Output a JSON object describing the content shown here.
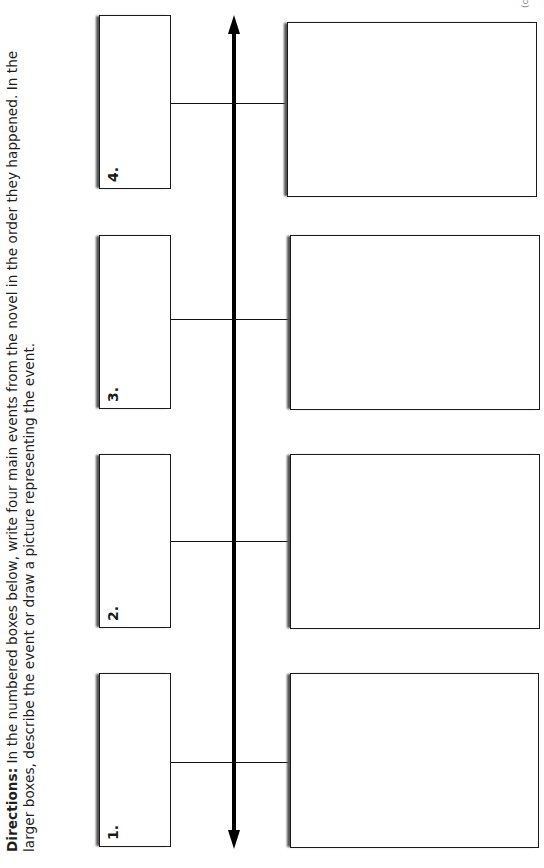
{
  "directions": {
    "label": "Directions:",
    "text": " In the numbered boxes below, write four main events from the novel in the order they happened. In the larger boxes, describe the event or draw a picture representing the event."
  },
  "corner_fragment": "(co",
  "timeline": {
    "orientation": "rotated-90-ccw",
    "direction": "bidirectional-arrow",
    "events": [
      {
        "number_label": "1.",
        "event_text": "",
        "description": ""
      },
      {
        "number_label": "2.",
        "event_text": "",
        "description": ""
      },
      {
        "number_label": "3.",
        "event_text": "",
        "description": ""
      },
      {
        "number_label": "4.",
        "event_text": "",
        "description": ""
      }
    ]
  },
  "colors": {
    "ink": "#1a1a1a",
    "shadow": "#555555",
    "background": "#ffffff"
  }
}
